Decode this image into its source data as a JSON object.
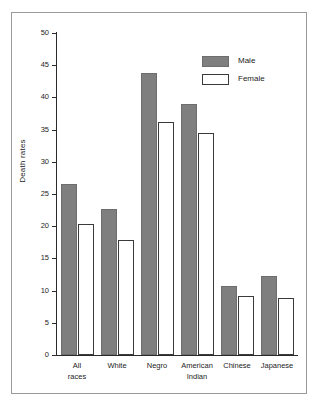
{
  "chart_data": {
    "type": "bar",
    "title": "",
    "xlabel": "",
    "ylabel": "Death rates",
    "ylim": [
      0,
      50
    ],
    "yticks": [
      0,
      5,
      10,
      15,
      20,
      25,
      30,
      35,
      40,
      45,
      50
    ],
    "ytick_labels": [
      "0",
      "5",
      "10",
      "15",
      "20",
      "25",
      "30",
      "35",
      "40",
      "45",
      "50"
    ],
    "grid": false,
    "legend_position": "top-right",
    "categories": [
      "All races",
      "White",
      "Negro",
      "American Indian",
      "Chinese",
      "Japanese"
    ],
    "category_lines": [
      [
        "All",
        "races"
      ],
      [
        "White",
        ""
      ],
      [
        "Negro",
        ""
      ],
      [
        "American",
        "Indian"
      ],
      [
        "Chinese",
        ""
      ],
      [
        "Japanese",
        ""
      ]
    ],
    "series": [
      {
        "name": "Male",
        "color": "#807f80",
        "values": [
          26.5,
          22.7,
          43.8,
          38.9,
          10.7,
          12.2
        ]
      },
      {
        "name": "Female",
        "color": "#ffffff",
        "values": [
          20.4,
          17.9,
          36.2,
          34.4,
          9.2,
          8.9
        ]
      }
    ]
  },
  "legend": {
    "items": [
      {
        "label": "Male",
        "style": "male"
      },
      {
        "label": "Female",
        "style": "female"
      }
    ]
  },
  "colors": {
    "male_fill": "#807f80",
    "female_fill": "#ffffff",
    "axis": "#2b2b2b",
    "frame": "#9a9a9a",
    "text": "#1d1d1d",
    "background": "#ffffff"
  }
}
